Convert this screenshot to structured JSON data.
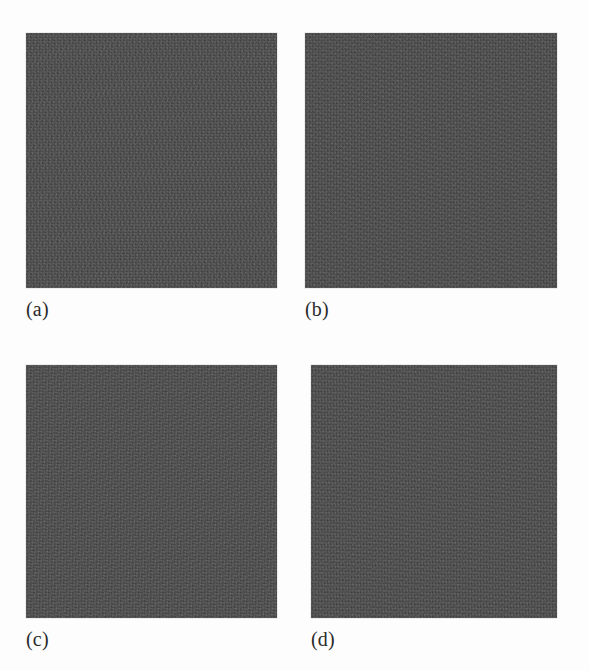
{
  "figure": {
    "background_color": "#fdfdfd",
    "width": 589,
    "height": 671,
    "layout": "2x2 grid of greyscale texture image panels with sub-figure captions",
    "panels": [
      {
        "id": "a",
        "label": "(a)",
        "fill_color": "#4d4d4d",
        "x": 26,
        "y": 33,
        "width": 251,
        "height": 255,
        "label_x": 26,
        "label_y": 298,
        "noise_class": "noise-a"
      },
      {
        "id": "b",
        "label": "(b)",
        "fill_color": "#4d4d4d",
        "x": 305,
        "y": 33,
        "width": 252,
        "height": 255,
        "label_x": 305,
        "label_y": 298,
        "noise_class": "noise-b"
      },
      {
        "id": "c",
        "label": "(c)",
        "fill_color": "#4d4d4d",
        "x": 26,
        "y": 365,
        "width": 251,
        "height": 253,
        "label_x": 26,
        "label_y": 628,
        "noise_class": "noise-c"
      },
      {
        "id": "d",
        "label": "(d)",
        "fill_color": "#4d4d4d",
        "x": 311,
        "y": 365,
        "width": 246,
        "height": 253,
        "label_x": 311,
        "label_y": 628,
        "noise_class": "noise-d"
      }
    ]
  }
}
